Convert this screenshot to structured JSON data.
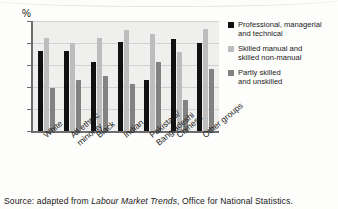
{
  "chart_data": {
    "type": "bar",
    "title": "",
    "subtitle": "",
    "xlabel": "",
    "ylabel": "%",
    "ylim": [
      0,
      50
    ],
    "yticks": [
      0,
      10,
      20,
      30,
      40,
      50
    ],
    "grid": true,
    "legend_position": "right",
    "categories": [
      "White",
      "All ethnic minority",
      "Black",
      "Indian",
      "Pakistani/ Bangladeshi",
      "Chinese",
      "Other groups"
    ],
    "category_lines": [
      [
        "White",
        ""
      ],
      [
        "All ethnic",
        "minority"
      ],
      [
        "Black",
        ""
      ],
      [
        "Indian",
        ""
      ],
      [
        "Pakistani/",
        "Bangladeshi"
      ],
      [
        "Chinese",
        ""
      ],
      [
        "Other groups",
        ""
      ]
    ],
    "series": [
      {
        "name": "Professional, managerial and technical",
        "color": "#111111",
        "values": [
          36.5,
          36.5,
          31.5,
          40.5,
          23,
          42,
          40
        ]
      },
      {
        "name": "Skilled manual and skilled non-manual",
        "color": "#bdbdbd",
        "values": [
          42.5,
          40,
          42.5,
          46,
          44,
          36,
          46.5
        ]
      },
      {
        "name": "Partly skilled and unskilled",
        "color": "#828282",
        "values": [
          19.5,
          23,
          25,
          21.5,
          31.5,
          14,
          28
        ]
      }
    ]
  },
  "axis": {
    "y_unit": "%",
    "ticks": [
      "50",
      "40",
      "30",
      "20",
      "10",
      "0"
    ]
  },
  "legend": {
    "items": [
      {
        "swatch": "s0",
        "line1": "Professional, managerial",
        "line2": "and technical"
      },
      {
        "swatch": "s1",
        "line1": "Skilled manual and",
        "line2": "skilled non-manual"
      },
      {
        "swatch": "s2",
        "line1": "Partly skilled",
        "line2": "and unskilled"
      }
    ]
  },
  "source": {
    "prefix": "Source: adapted from ",
    "italic": "Labour Market Trends",
    "suffix": ", Office for National Statistics."
  }
}
